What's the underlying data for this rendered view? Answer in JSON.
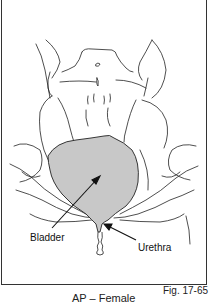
{
  "figure": {
    "number": "Fig. 17-65",
    "caption": "AP – Female",
    "labels": {
      "bladder": "Bladder",
      "urethra": "Urethra"
    },
    "colors": {
      "bladder_fill": "#c8c8c8",
      "line": "#222222",
      "frame": "#333333"
    }
  }
}
